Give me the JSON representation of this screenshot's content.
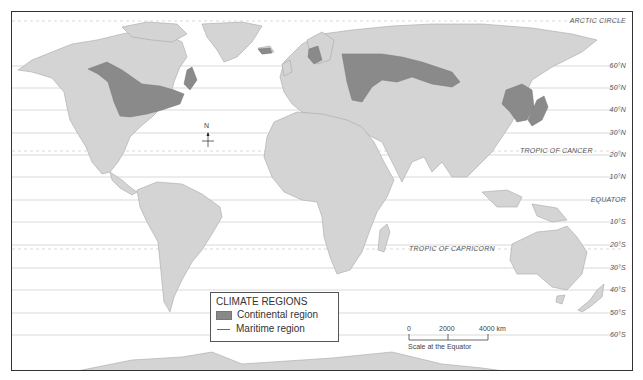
{
  "map": {
    "title": "Climate Regions World Map",
    "colors": {
      "land": "#d4d4d4",
      "continental": "#8a8a8a",
      "ocean": "#ffffff",
      "border": "#9a9a9a",
      "gridline": "#c8c8c8"
    },
    "latitudes": [
      {
        "label": "ARCTIC CIRCLE",
        "y": 20,
        "dashed": true
      },
      {
        "label": "60°N",
        "y": 65
      },
      {
        "label": "50°N",
        "y": 87
      },
      {
        "label": "40°N",
        "y": 109
      },
      {
        "label": "30°N",
        "y": 132
      },
      {
        "label": "TROPIC OF CANCER",
        "y": 150,
        "dashed": true
      },
      {
        "label": "20°N",
        "y": 154
      },
      {
        "label": "10°N",
        "y": 176
      },
      {
        "label": "EQUATOR",
        "y": 199
      },
      {
        "label": "10°S",
        "y": 221
      },
      {
        "label": "TROPIC OF CAPRICORN",
        "y": 248,
        "dashed": true
      },
      {
        "label": "20°S",
        "y": 244
      },
      {
        "label": "30°S",
        "y": 267
      },
      {
        "label": "40°S",
        "y": 289
      },
      {
        "label": "50°S",
        "y": 312
      },
      {
        "label": "60°S",
        "y": 334
      }
    ],
    "compass": {
      "label": "N"
    },
    "legend": {
      "title": "CLIMATE REGIONS",
      "items": [
        {
          "label": "Continental region",
          "type": "swatch"
        },
        {
          "label": "Maritime region",
          "type": "line"
        }
      ]
    },
    "scale": {
      "ticks": [
        "0",
        "2000",
        "4000 km"
      ],
      "caption": "Scale at the Equator"
    }
  }
}
